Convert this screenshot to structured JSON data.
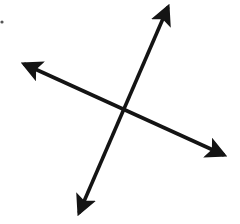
{
  "diagram": {
    "type": "intersecting-lines",
    "stroke_color": "#141414",
    "background": "#ffffff",
    "intersection": [
      123,
      110
    ],
    "lines": [
      {
        "name": "line-a",
        "from": [
          77,
          218
        ],
        "to": [
          170,
          2
        ]
      },
      {
        "name": "line-b",
        "from": [
          19,
          62
        ],
        "to": [
          229,
          157
        ]
      }
    ],
    "mark": {
      "x": 2,
      "y": 22
    }
  }
}
